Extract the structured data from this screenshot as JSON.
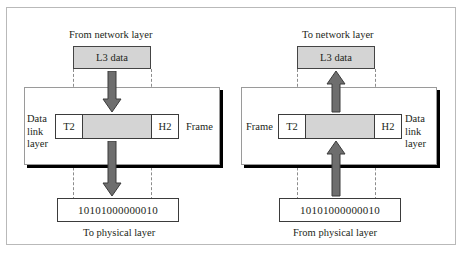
{
  "figure": {
    "colors": {
      "data_fill": "#d4d4d4",
      "arrow_fill": "#6e6e6e",
      "arrow_stroke": "#3b3b3b",
      "panel_border": "#9a9a9a",
      "shadow": "#000000",
      "text": "#231f20",
      "guide": "#8c8c8c"
    }
  },
  "left_panel": {
    "top_caption": "From network layer",
    "l3_box_label": "L3 data",
    "layer_label": "Data\nlink\nlayer",
    "layer_label_lines": [
      "Data",
      "link",
      "layer"
    ],
    "frame": {
      "trailer_label": "T2",
      "payload_label": "",
      "header_label": "H2",
      "frame_label": "Frame"
    },
    "bits": "10101000000010",
    "bottom_caption": "To physical layer",
    "arrows": [
      {
        "name": "arrow-network-to-datalink",
        "direction": "down"
      },
      {
        "name": "arrow-datalink-to-physical",
        "direction": "down"
      }
    ]
  },
  "right_panel": {
    "top_caption": "To network layer",
    "l3_box_label": "L3 data",
    "layer_label_lines": [
      "Data",
      "link",
      "layer"
    ],
    "frame": {
      "trailer_label": "T2",
      "payload_label": "",
      "header_label": "H2",
      "frame_label": "Frame"
    },
    "bits": "10101000000010",
    "bottom_caption": "From physical layer",
    "arrows": [
      {
        "name": "arrow-datalink-to-network",
        "direction": "up"
      },
      {
        "name": "arrow-physical-to-datalink",
        "direction": "up"
      }
    ]
  }
}
